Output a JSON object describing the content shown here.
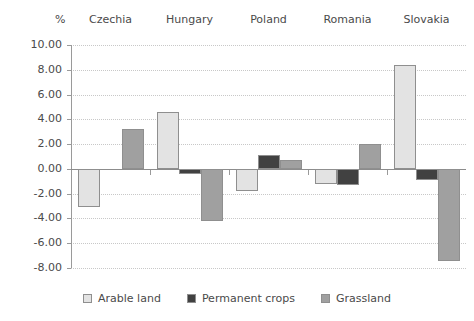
{
  "chart_data": {
    "type": "bar",
    "title": "",
    "subtitle": "",
    "xlabel": "",
    "ylabel": "%",
    "unit_label": "%",
    "categories": [
      "Czechia",
      "Hungary",
      "Poland",
      "Romania",
      "Slovakia"
    ],
    "series": [
      {
        "name": "Arable land",
        "color": "#e3e3e3",
        "values": [
          -3.1,
          4.6,
          -1.8,
          -1.2,
          8.4
        ]
      },
      {
        "name": "Permanent crops",
        "color": "#414141",
        "values": [
          0.0,
          -0.4,
          1.1,
          -1.3,
          -0.9
        ]
      },
      {
        "name": "Grassland",
        "color": "#a0a0a0",
        "values": [
          3.2,
          -4.2,
          0.7,
          2.0,
          -7.4
        ]
      }
    ],
    "ylim": [
      -8.0,
      10.0
    ],
    "yticks": [
      10.0,
      8.0,
      6.0,
      4.0,
      2.0,
      0.0,
      -2.0,
      -4.0,
      -6.0,
      -8.0
    ],
    "ytick_labels": [
      "10.00",
      "8.00",
      "6.00",
      "4.00",
      "2.00",
      "0.00",
      "-2.00",
      "-4.00",
      "-6.00",
      "-8.00"
    ],
    "grid": true,
    "grid_axis": "y",
    "legend_position": "bottom",
    "category_label_position": "top",
    "axis_colors": {
      "grid": "#c8c8c8",
      "axis": "#9a9a9a",
      "zero": "#8c8c8c",
      "bar_border": "#8f8f8f",
      "text": "#4a4a4a"
    }
  }
}
